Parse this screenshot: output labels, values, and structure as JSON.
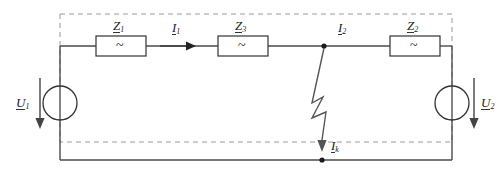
{
  "diagram": {
    "colors": {
      "wire": "#4a4a4a",
      "dashed_boundary": "#8c8c8c",
      "text": "#222222",
      "background": "#ffffff"
    },
    "impedances": [
      {
        "id": "z1",
        "label": "Z",
        "subscript": "1",
        "symbol": "~"
      },
      {
        "id": "z3",
        "label": "Z",
        "subscript": "3",
        "symbol": "~"
      },
      {
        "id": "z2",
        "label": "Z",
        "subscript": "2",
        "symbol": "~"
      }
    ],
    "currents": [
      {
        "id": "i1",
        "label": "I",
        "subscript": "1"
      },
      {
        "id": "i2",
        "label": "I",
        "subscript": "2"
      },
      {
        "id": "ik",
        "label": "I",
        "subscript": "k"
      }
    ],
    "sources": [
      {
        "id": "u1",
        "label": "U",
        "subscript": "1",
        "symbol": "circle"
      },
      {
        "id": "u2",
        "label": "U",
        "subscript": "2",
        "symbol": "circle"
      }
    ],
    "fault": {
      "name": "short-circuit-lightning",
      "description": "zigzag fault path from top rail junction to bottom rail"
    }
  }
}
